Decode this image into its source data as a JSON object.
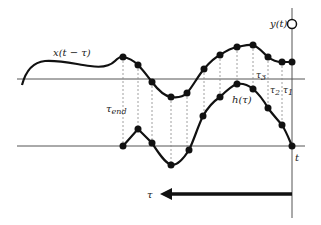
{
  "diagram": {
    "labels": {
      "input_signal": "x(t − τ)",
      "impulse_response": "h(τ)",
      "output": "y(t)",
      "time": "t",
      "tau_axis": "τ",
      "tau_end": "τ",
      "tau_end_sub": "end",
      "tau1": "τ",
      "tau1_sub": "1",
      "tau2": "τ",
      "tau2_sub": "2",
      "tau3": "τ",
      "tau3_sub": "3"
    },
    "colors": {
      "curve": "#111111",
      "axis": "#555555",
      "dotted": "#888888",
      "background": "#ffffff"
    },
    "upper_axis_y": 79,
    "lower_axis_y": 146,
    "t_line_x": 292,
    "sample_x": [
      123,
      138,
      152,
      171,
      187,
      204,
      220,
      237,
      253,
      268,
      282,
      292
    ],
    "upper_samples_y": [
      57,
      65,
      82,
      97,
      93,
      69,
      55,
      47,
      45,
      57,
      62,
      62
    ],
    "lower_samples_y": [
      146,
      129,
      143,
      165,
      150,
      116,
      97,
      84,
      89,
      108,
      125,
      146
    ]
  }
}
